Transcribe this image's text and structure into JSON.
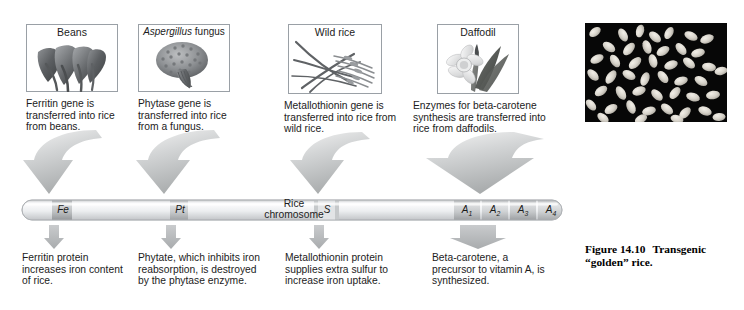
{
  "figure": {
    "caption_label": "Figure 14.10",
    "caption_text": "Transgenic “golden” rice."
  },
  "sources": [
    {
      "id": "beans",
      "title": "Beans",
      "title_italic_part": "",
      "art": "beans-illustration",
      "caption": "Ferritin gene is transferred into rice from beans."
    },
    {
      "id": "aspergillus",
      "title_italic_part": "Aspergillus",
      "title": " fungus",
      "art": "fungus-illustration",
      "caption": "Phytase gene is transferred into rice from a fungus."
    },
    {
      "id": "wild-rice",
      "title": "Wild rice",
      "title_italic_part": "",
      "art": "wild-rice-illustration",
      "caption": "Metallothionin gene is transferred into rice from wild rice."
    },
    {
      "id": "daffodil",
      "title": "Daffodil",
      "title_italic_part": "",
      "art": "daffodil-illustration",
      "caption": "Enzymes for beta-carotene synthesis are transferred into rice from daffodils."
    }
  ],
  "chromosome": {
    "label_line1": "Rice",
    "label_line2": "chromosome",
    "genes": [
      {
        "id": "fe",
        "label": "Fe",
        "subscript": ""
      },
      {
        "id": "pt",
        "label": "Pt",
        "subscript": ""
      },
      {
        "id": "s",
        "label": "S",
        "subscript": ""
      },
      {
        "id": "a1",
        "label": "A",
        "subscript": "1"
      },
      {
        "id": "a2",
        "label": "A",
        "subscript": "2"
      },
      {
        "id": "a3",
        "label": "A",
        "subscript": "3"
      },
      {
        "id": "a4",
        "label": "A",
        "subscript": "4"
      }
    ]
  },
  "results": [
    {
      "id": "ferritin",
      "text": "Ferritin protein increases iron content of rice."
    },
    {
      "id": "phytate",
      "text": "Phytate, which inhibits iron reabsorption, is destroyed by the phytase enzyme."
    },
    {
      "id": "metallothionin",
      "text": "Metallothionin protein supplies extra sulfur to increase iron uptake."
    },
    {
      "id": "beta-carotene",
      "text": "Beta-carotene, a precursor to vitamin A, is synthesized."
    }
  ],
  "colors": {
    "arrow_gray": "#b9bcbd",
    "panel_border": "#9aa0a6",
    "chromosome_body": "#e9eaec",
    "gene_band": "#b5b8ba",
    "photo_background": "#070707",
    "grain": "#dcd8d0"
  }
}
